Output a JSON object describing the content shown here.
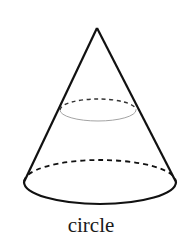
{
  "diagram": {
    "label": "circle",
    "colors": {
      "stroke": "#111111",
      "thin_stroke": "#999999",
      "background": "#ffffff"
    },
    "shapes": [
      "cone",
      "cross-section-circle",
      "base-circle"
    ]
  }
}
